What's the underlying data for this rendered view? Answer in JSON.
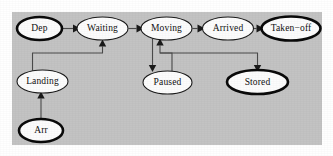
{
  "diagram": {
    "type": "state-transition-diagram",
    "canvas": {
      "width": 333,
      "height": 156
    },
    "panel": {
      "color": "#c3c3c3",
      "x": 12,
      "y": 12,
      "width": 310,
      "height": 133
    },
    "style": {
      "node_fill": "#fcfcfc",
      "node_stroke": "#1b1b1b",
      "edge_stroke": "#4a4a4a",
      "arrow_fill": "#1a1a1a",
      "thin_border_width": 1.1,
      "thick_border_width": 2.6
    },
    "nodes": [
      {
        "id": "dep",
        "label": "Dep",
        "cx": 39.5,
        "cy": 28.5,
        "rx": 22.5,
        "ry": 11.5,
        "border": "thick"
      },
      {
        "id": "waiting",
        "label": "Waiting",
        "cx": 102.5,
        "cy": 28.5,
        "rx": 25.5,
        "ry": 11.5,
        "border": "thin"
      },
      {
        "id": "moving",
        "label": "Moving",
        "cx": 166.5,
        "cy": 28.5,
        "rx": 25.5,
        "ry": 11.5,
        "border": "thin"
      },
      {
        "id": "arrived",
        "label": "Arrived",
        "cx": 228.0,
        "cy": 28.5,
        "rx": 25.5,
        "ry": 11.5,
        "border": "thin"
      },
      {
        "id": "takenoff",
        "label": "Taken−off",
        "cx": 291.0,
        "cy": 28.5,
        "rx": 29.5,
        "ry": 12.0,
        "border": "thick"
      },
      {
        "id": "landing",
        "label": "Landing",
        "cx": 42.5,
        "cy": 81.5,
        "rx": 25.5,
        "ry": 11.5,
        "border": "thin"
      },
      {
        "id": "paused",
        "label": "Paused",
        "cx": 167.5,
        "cy": 82.5,
        "rx": 24.5,
        "ry": 11.5,
        "border": "thin"
      },
      {
        "id": "stored",
        "label": "Stored",
        "cx": 257.5,
        "cy": 82.0,
        "rx": 30.5,
        "ry": 12.0,
        "border": "thick"
      },
      {
        "id": "arr",
        "label": "Arr",
        "cx": 41.0,
        "cy": 130.5,
        "rx": 22.0,
        "ry": 11.5,
        "border": "thick"
      }
    ],
    "edges": [
      {
        "id": "dep-waiting",
        "from": "Dep",
        "to": "Waiting",
        "path": "M 62.5 28.5 L 73.5 28.5",
        "arrow": {
          "x": 77.0,
          "y": 28.5,
          "dir": "right"
        }
      },
      {
        "id": "waiting-moving",
        "from": "Waiting",
        "to": "Moving",
        "path": "M 128.5 28.5 L 137.0 28.5",
        "arrow": {
          "x": 141.0,
          "y": 28.5,
          "dir": "right"
        }
      },
      {
        "id": "moving-arrived",
        "from": "Moving",
        "to": "Arrived",
        "path": "M 192.5 28.5 L 198.5 28.5",
        "arrow": {
          "x": 202.5,
          "y": 28.5,
          "dir": "right"
        }
      },
      {
        "id": "arrived-takenoff",
        "from": "Arrived",
        "to": "Taken−off",
        "path": "M 254.0 28.5 L 257.5 28.5",
        "arrow": {
          "x": 261.5,
          "y": 28.5,
          "dir": "right"
        }
      },
      {
        "id": "landing-waiting",
        "from": "Landing",
        "to": "Waiting",
        "path": "M 32.5 70.5 L 32.5 53.0 L 102.5 53.0 L 102.5 45.5",
        "arrow": {
          "x": 102.5,
          "y": 41.0,
          "dir": "up"
        }
      },
      {
        "id": "arr-landing",
        "from": "Arr",
        "to": "Landing",
        "path": "M 41.0 119.0 L 41.0 97.5",
        "arrow": {
          "x": 41.0,
          "y": 93.5,
          "dir": "up"
        }
      },
      {
        "id": "moving-paused",
        "from": "Moving",
        "to": "Paused",
        "path": "M 152.5 38.5 L 152.5 66.0",
        "arrow": {
          "x": 152.5,
          "y": 70.5,
          "dir": "down"
        }
      },
      {
        "id": "paused-moving",
        "from": "Paused",
        "to": "Moving",
        "path": "M 172.0 71.0 L 172.0 53.0 L 160.0 53.0 L 160.0 45.0",
        "arrow": {
          "x": 160.0,
          "y": 40.5,
          "dir": "up"
        }
      },
      {
        "id": "moving-stored",
        "from": "Moving",
        "to": "Stored",
        "path": "M 160.0 53.0 L 257.5 53.0 L 257.5 66.0",
        "arrow": {
          "x": 257.5,
          "y": 70.5,
          "dir": "down"
        }
      }
    ]
  }
}
